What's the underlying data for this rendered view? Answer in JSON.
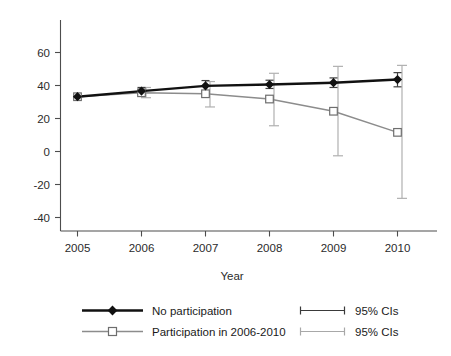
{
  "chart_data": {
    "type": "line",
    "title": "",
    "subtitle": "",
    "xlabel": "Year",
    "ylabel": "",
    "x": [
      2005,
      2006,
      2007,
      2008,
      2009,
      2010
    ],
    "xticklabels": [
      "2005",
      "2006",
      "2007",
      "2008",
      "2009",
      "2010"
    ],
    "yticklabels": [
      "60",
      "40",
      "20",
      "0",
      "-20",
      "-40"
    ],
    "yticks": [
      60,
      40,
      20,
      0,
      -20,
      -40
    ],
    "ylim": [
      -52,
      72
    ],
    "xlim": [
      2004.6,
      2010.6
    ],
    "grid": false,
    "legend_position": "below-plot",
    "series": [
      {
        "name": "No participation",
        "color": "#111111",
        "marker": "filled-diamond",
        "values": [
          33.2,
          36.6,
          39.8,
          40.6,
          41.7,
          43.6
        ],
        "ci_lower": [
          33.2,
          34.6,
          36.6,
          38.2,
          38.8,
          39.2
        ],
        "ci_upper": [
          33.2,
          38.8,
          43.0,
          43.2,
          44.6,
          47.8
        ],
        "ci_label": "95% CIs"
      },
      {
        "name": "Participation in 2006-2010",
        "color": "#808080",
        "marker": "open-square",
        "values": [
          33.2,
          35.6,
          35.0,
          31.8,
          24.4,
          11.6
        ],
        "ci_lower": [
          33.2,
          32.6,
          27.0,
          15.6,
          -2.6,
          -28.4
        ],
        "ci_upper": [
          33.2,
          38.8,
          42.4,
          47.4,
          51.6,
          52.2
        ],
        "ci_label": "95% CIs"
      }
    ]
  },
  "legend": {
    "entries": [
      {
        "label": "No participation",
        "marker": "filled-diamond",
        "color": "#111111"
      },
      {
        "label": "Participation in 2006-2010",
        "marker": "open-square",
        "color": "#808080"
      },
      {
        "label": "95% CIs",
        "marker": "error-bar",
        "color": "#3a3a3a"
      },
      {
        "label": "95% CIs",
        "marker": "error-bar",
        "color": "#9a9a9a"
      }
    ]
  },
  "axis": {
    "x_title": "Year"
  },
  "colors": {
    "series_dark": "#111111",
    "series_gray": "#808080",
    "axis": "#4d4d4d",
    "background": "#ffffff"
  }
}
